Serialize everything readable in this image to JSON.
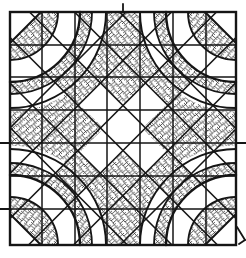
{
  "figure": {
    "kind": "hand-drawn quilt block pattern (winding-ways style) with crosshatched shading",
    "canvas": {
      "width": 246,
      "height": 258
    },
    "colors": {
      "paper": "#ffffff",
      "ink": "#151515",
      "hatch": "#1d1d1d"
    },
    "block": {
      "x0": 10,
      "y0": 12,
      "x1": 236,
      "y1": 245,
      "border_width": 2.4
    },
    "grid": {
      "verticals": [
        42,
        75,
        107,
        140,
        173,
        206
      ],
      "horizontals": [
        45,
        77,
        110,
        143,
        176,
        209
      ],
      "stroke_width": 1.5
    },
    "corner": {
      "chord_offset": 31,
      "arc_radii": [
        48,
        70,
        82,
        96
      ],
      "arc_widths": [
        1.9,
        2.4,
        1.8,
        1.9
      ],
      "band_fill_radii": [
        48,
        70,
        82
      ],
      "chord_width": 2.0
    },
    "funnel": {
      "tip_half": 17,
      "radius": 96,
      "corner_dist": 113,
      "side_pt": [
        36,
        57.5
      ],
      "apex": [
        0,
        93.5
      ],
      "centers": [
        {
          "tx": 123,
          "ty": 12,
          "rot": 0
        },
        {
          "tx": 236,
          "ty": 128.5,
          "rot": 90
        },
        {
          "tx": 123,
          "ty": 245,
          "rot": 180
        },
        {
          "tx": 10,
          "ty": 128.5,
          "rot": 270
        }
      ]
    },
    "lattice": {
      "down_xplusy": [
        138,
        183.5,
        228.5,
        273.5,
        318.5,
        365
      ],
      "up_xminusy": [
        -117.5,
        -73,
        -27.5,
        17.5,
        62.5,
        107.5
      ],
      "stroke_width": 1.6
    },
    "diamonds": [
      [
        [
          55.25,
          82.75
        ],
        [
          77.75,
          60.25
        ],
        [
          100.5,
          83
        ],
        [
          78,
          105.5
        ]
      ],
      [
        [
          145.5,
          83
        ],
        [
          168,
          60.5
        ],
        [
          190.5,
          83
        ],
        [
          168,
          105.5
        ]
      ],
      [
        [
          55.5,
          173
        ],
        [
          77.75,
          150.75
        ],
        [
          100.25,
          173.25
        ],
        [
          78,
          195.5
        ]
      ],
      [
        [
          145.5,
          173
        ],
        [
          168,
          150.5
        ],
        [
          191.25,
          173.75
        ],
        [
          168.75,
          196.25
        ]
      ]
    ],
    "ticks": [
      [
        123,
        4,
        123,
        12
      ],
      [
        0,
        143,
        10,
        143
      ],
      [
        236,
        143,
        246,
        143
      ],
      [
        0,
        209,
        10,
        209
      ],
      [
        237,
        227,
        245,
        240
      ],
      [
        245,
        240,
        239,
        244
      ]
    ],
    "hatch": {
      "tile": 7,
      "stroke_width": 0.75,
      "angle_deg": 5
    }
  }
}
